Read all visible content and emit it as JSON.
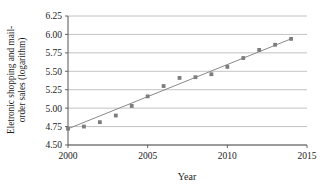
{
  "chart_data": {
    "type": "scatter",
    "title": "",
    "xlabel": "Year",
    "ylabel": "Eletronic shopping and mail-order sales (logarithm)",
    "ylabel_line1": "Eletronic shopping and mail-",
    "ylabel_line2": "order sales (logarithm)",
    "xlim": [
      2000,
      2015
    ],
    "ylim": [
      4.5,
      6.25
    ],
    "xticks": [
      2000,
      2005,
      2010,
      2015
    ],
    "xtick_labels": [
      "2000",
      "2005",
      "2010",
      "2015"
    ],
    "yticks": [
      4.5,
      4.75,
      5.0,
      5.25,
      5.5,
      5.75,
      6.0,
      6.25
    ],
    "ytick_labels": [
      "4.50",
      "4.75",
      "5.00",
      "5.25",
      "5.50",
      "5.75",
      "6.00",
      "6.25"
    ],
    "grid": "horizontal",
    "legend": "none",
    "x": [
      2000,
      2001,
      2002,
      2003,
      2004,
      2005,
      2006,
      2007,
      2008,
      2009,
      2010,
      2011,
      2012,
      2013,
      2014
    ],
    "values": [
      4.72,
      4.75,
      4.81,
      4.9,
      5.03,
      5.16,
      5.3,
      5.41,
      5.42,
      5.46,
      5.56,
      5.68,
      5.79,
      5.86,
      5.94
    ],
    "series": [
      {
        "name": "Eletronic shopping and mail-order sales",
        "marker": "square",
        "marker_color": "#7d7d7d",
        "values": [
          4.72,
          4.75,
          4.81,
          4.9,
          5.03,
          5.16,
          5.3,
          5.41,
          5.42,
          5.46,
          5.56,
          5.68,
          5.79,
          5.86,
          5.94
        ]
      }
    ],
    "trendline": {
      "name": "linear fit",
      "color": "#8a8a8a",
      "x_start": 2000,
      "y_start": 4.72,
      "x_end": 2014,
      "y_end": 5.94
    }
  },
  "colors": {
    "marker": "#7d7d7d",
    "trendline": "#8a8a8a",
    "grid": "#b3b3b3",
    "axis": "#555555",
    "text": "#1a1a1a",
    "background": "#ffffff"
  }
}
